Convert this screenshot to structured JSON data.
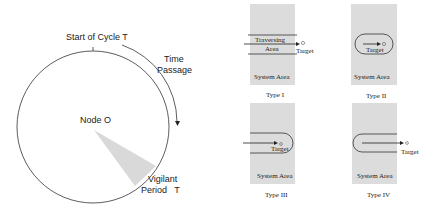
{
  "left_diagram": {
    "start_label": "Start of Cycle T",
    "time_label_line1": "Time",
    "time_label_line2": "Passage",
    "node_label": "Node O",
    "vigilant_line1": "Vigilant",
    "vigilant_line2": "Period   T",
    "colors": {
      "circle_stroke": "#333333",
      "sector_fill": "#d9d9d9"
    }
  },
  "right_diagram": {
    "panels": [
      {
        "caption": "Type I",
        "area_label": "System Area",
        "track_label_line1": "Traversing",
        "track_label_line2": "Area",
        "target_label": "Target"
      },
      {
        "caption": "Type II",
        "area_label": "System Area",
        "target_label": "Target"
      },
      {
        "caption": "Type III",
        "area_label": "System Area",
        "target_label": "Target"
      },
      {
        "caption": "Type IV",
        "area_label": "System Area",
        "target_label": "Target"
      }
    ],
    "colors": {
      "area_fill": "#dcdcdc",
      "line": "#333333"
    }
  }
}
